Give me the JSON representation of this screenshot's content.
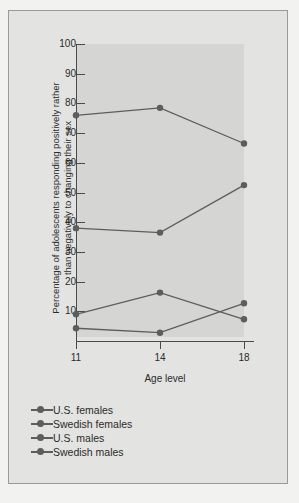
{
  "chart_data": {
    "type": "line",
    "title": "",
    "xlabel": "Age level",
    "ylabel": "Percentage of adolescents responding positively rather than negatively to changing their sex",
    "categories": [
      "11",
      "14",
      "18"
    ],
    "x": [
      11,
      14,
      18
    ],
    "xlim": [
      11,
      18
    ],
    "ylim": [
      0,
      100
    ],
    "yticks": [
      10,
      20,
      30,
      40,
      50,
      60,
      70,
      80,
      90,
      100
    ],
    "xticks": [
      "11",
      "14",
      "18"
    ],
    "grid": false,
    "legend_position": "below-left",
    "series": [
      {
        "name": "U.S. females",
        "values": [
          76.0,
          78.5,
          66.5
        ],
        "color": "#5d5d5d"
      },
      {
        "name": "Swedish females",
        "values": [
          38.0,
          36.5,
          52.5
        ],
        "color": "#5d5d5d"
      },
      {
        "name": "U.S. males",
        "values": [
          9.0,
          16.3,
          7.3
        ],
        "color": "#5d5d5d"
      },
      {
        "name": "Swedish males",
        "values": [
          4.3,
          2.8,
          12.7
        ],
        "color": "#5d5d5d"
      }
    ]
  },
  "axis": {
    "y_tick_labels": [
      "100",
      "90",
      "80",
      "70",
      "60",
      "50",
      "40",
      "30",
      "20",
      "10"
    ],
    "x_tick_labels": [
      "11",
      "14",
      "18"
    ],
    "y_axis_title": "Percentage of adolescents responding positively rather than negatively to changing their sex",
    "x_axis_title": "Age level"
  },
  "legend": {
    "items": [
      {
        "label": "U.S. females"
      },
      {
        "label": "Swedish females"
      },
      {
        "label": "U.S. males"
      },
      {
        "label": "Swedish males"
      }
    ]
  },
  "colors": {
    "page_background": "#f2f2f0",
    "figure_background": "#e3e3e1",
    "plot_background": "#d5d5d3",
    "axis": "#4a4a4a",
    "series": "#5d5d5d",
    "text": "#2b2b2b",
    "frame_border": "#9a9a98"
  }
}
